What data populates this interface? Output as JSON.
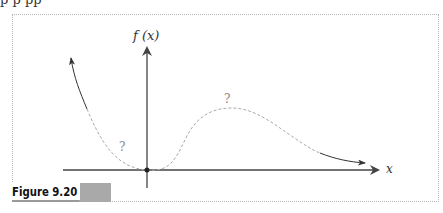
{
  "figure": {
    "caption": "Figure 9.20",
    "top_fragment": "p  p  pp"
  },
  "axes": {
    "y_label": "f (x)",
    "x_label": "x"
  },
  "annotations": {
    "left_unknown": "?",
    "peak_unknown": "?"
  },
  "colors": {
    "axis": "#444444",
    "dashed_curve": "#aaaaaa",
    "solid_curve": "#333333",
    "frame": "#b8b8b8",
    "caption_bar": "#a9a9a9"
  },
  "diagram": {
    "type": "function-sketch"
  }
}
